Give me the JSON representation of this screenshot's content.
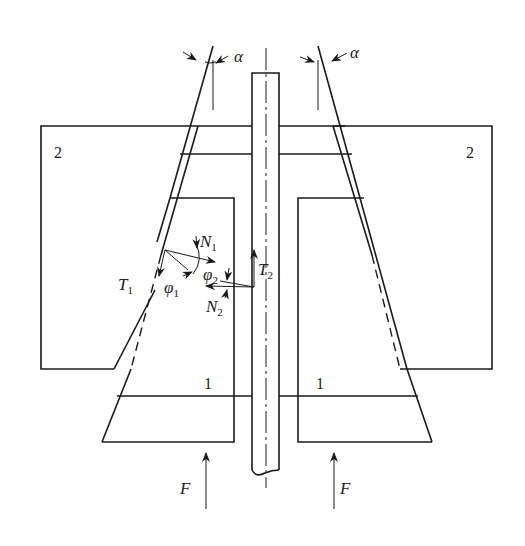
{
  "diagram": {
    "type": "mechanical cross-section (cone clutch / conical friction coupling)",
    "labels": {
      "alpha_left": "α",
      "alpha_right": "α",
      "part2_left": "2",
      "part2_right": "2",
      "part1_left": "1",
      "part1_right": "1",
      "force_left": "F",
      "force_right": "F",
      "T1": "T",
      "T1_sub": "1",
      "T2": "T",
      "T2_sub": "2",
      "N1": "N",
      "N1_sub": "1",
      "N2": "N",
      "N2_sub": "2",
      "phi1": "φ",
      "phi1_sub": "1",
      "phi2": "φ",
      "phi2_sub": "2"
    },
    "colors": {
      "line": "#1a1a1a",
      "background": "#ffffff"
    }
  }
}
